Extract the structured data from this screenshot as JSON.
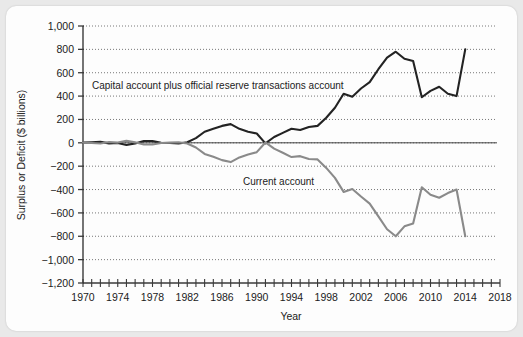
{
  "chart_data": {
    "type": "line",
    "title": "",
    "xlabel": "Year",
    "ylabel": "Surplus or Deficit ($ billions)",
    "xlim": [
      1970,
      2018
    ],
    "ylim": [
      -1200,
      1000
    ],
    "ytick_step": 200,
    "xtick_label_step": 4,
    "xtick_minor_step": 1,
    "grid": "horizontal dotted gridlines at every 200",
    "legend_position": "inline annotations on plot",
    "ytick_labels": [
      "1,000",
      "800",
      "600",
      "400",
      "200",
      "0",
      "−200",
      "−400",
      "−600",
      "−800",
      "−1,000",
      "−1,200"
    ],
    "ytick_values": [
      1000,
      800,
      600,
      400,
      200,
      0,
      -200,
      -400,
      -600,
      -800,
      -1000,
      -1200
    ],
    "xtick_labels": [
      "1970",
      "1974",
      "1978",
      "1982",
      "1986",
      "1990",
      "1994",
      "1998",
      "2002",
      "2006",
      "2010",
      "2014",
      "2018"
    ],
    "xtick_values": [
      1970,
      1974,
      1978,
      1982,
      1986,
      1990,
      1994,
      1998,
      2002,
      2006,
      2010,
      2014,
      2018
    ],
    "series": [
      {
        "name": "Capital account plus official reserve transactions account",
        "color": "#232323",
        "annotation": "Capital account plus official reserve transactions account",
        "x": [
          1970,
          1971,
          1972,
          1973,
          1974,
          1975,
          1976,
          1977,
          1978,
          1979,
          1980,
          1981,
          1982,
          1983,
          1984,
          1985,
          1986,
          1987,
          1988,
          1989,
          1990,
          1991,
          1992,
          1993,
          1994,
          1995,
          1996,
          1997,
          1998,
          1999,
          2000,
          2001,
          2002,
          2003,
          2004,
          2005,
          2006,
          2007,
          2008,
          2009,
          2010,
          2011,
          2012,
          2013,
          2014
        ],
        "y": [
          3,
          5,
          8,
          -5,
          -2,
          -18,
          -5,
          15,
          16,
          1,
          -2,
          -6,
          5,
          40,
          95,
          120,
          145,
          160,
          120,
          95,
          80,
          -5,
          50,
          85,
          120,
          110,
          135,
          145,
          215,
          300,
          420,
          395,
          465,
          520,
          630,
          730,
          780,
          720,
          700,
          390,
          445,
          480,
          420,
          400,
          800
        ]
      },
      {
        "name": "Current account",
        "color": "#8a8a8a",
        "annotation": "Current account",
        "x": [
          1970,
          1971,
          1972,
          1973,
          1974,
          1975,
          1976,
          1977,
          1978,
          1979,
          1980,
          1981,
          1982,
          1983,
          1984,
          1985,
          1986,
          1987,
          1988,
          1989,
          1990,
          1991,
          1992,
          1993,
          1994,
          1995,
          1996,
          1997,
          1998,
          1999,
          2000,
          2001,
          2002,
          2003,
          2004,
          2005,
          2006,
          2007,
          2008,
          2009,
          2010,
          2011,
          2012,
          2013,
          2014
        ],
        "y": [
          2,
          -1,
          -6,
          7,
          2,
          18,
          4,
          -14,
          -15,
          -1,
          2,
          5,
          -6,
          -40,
          -95,
          -120,
          -148,
          -165,
          -125,
          -100,
          -80,
          3,
          -50,
          -85,
          -122,
          -114,
          -138,
          -142,
          -215,
          -300,
          -420,
          -395,
          -460,
          -520,
          -630,
          -740,
          -800,
          -715,
          -690,
          -380,
          -445,
          -470,
          -430,
          -400,
          -800
        ]
      }
    ]
  },
  "annotations": {
    "capital_label": "Capital account plus official reserve transactions account",
    "current_label": "Current account"
  },
  "axes": {
    "x_title": "Year",
    "y_title": "Surplus or Deficit ($ billions)"
  }
}
